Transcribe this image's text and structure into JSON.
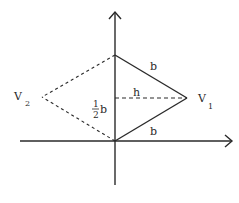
{
  "diagram": {
    "colors": {
      "line": "#2a2a2a",
      "background": "#ffffff"
    },
    "axes": {
      "x_axis": {
        "x1": 20,
        "y": 141,
        "x2": 232,
        "icon": "arrow-right-icon"
      },
      "y_axis": {
        "x": 115,
        "y1": 185,
        "y2": 12,
        "icon": "arrow-up-icon"
      }
    },
    "points": {
      "origin": {
        "x": 115,
        "y": 141
      },
      "top": {
        "x": 115,
        "y": 55
      },
      "V1": {
        "x": 187,
        "y": 98
      },
      "V2": {
        "x": 42,
        "y": 97
      },
      "mid": {
        "x": 115,
        "y": 98
      }
    },
    "labels": {
      "V1": {
        "main": "V",
        "sub": "1"
      },
      "V2": {
        "main": "V",
        "sub": "2"
      },
      "b_upper": "b",
      "b_lower": "b",
      "h": "h",
      "half_b": {
        "numerator": "1",
        "denominator": "2",
        "symbol": "b"
      }
    },
    "segments": {
      "solid": [
        "top-V1",
        "origin-V1",
        "origin-top"
      ],
      "dashed": [
        "top-V2",
        "origin-V2",
        "mid-V1"
      ]
    }
  }
}
